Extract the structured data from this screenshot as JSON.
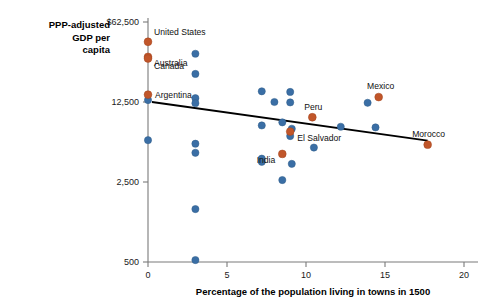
{
  "chart_data": {
    "type": "scatter",
    "title": "",
    "xlabel": "Percentage of the population living in towns in 1500",
    "ylabel": "PPP-adjusted GDP per capita",
    "ylabel_lines": [
      "PPP-adjusted",
      "GDP per",
      "capita"
    ],
    "xlim": [
      0,
      20
    ],
    "ylim": [
      500,
      62500
    ],
    "yscale": "log",
    "grid": false,
    "legend": "none",
    "xticks": [
      0,
      5,
      10,
      15,
      20
    ],
    "xtick_labels": [
      "0",
      "5",
      "10",
      "15",
      "20"
    ],
    "yticks": [
      500,
      2500,
      12500,
      62500
    ],
    "ytick_labels": [
      "500",
      "2,500",
      "12,500",
      "$62,500"
    ],
    "colors": {
      "highlight": "#c1562a",
      "other": "#3a6ea5",
      "trendline": "#000000",
      "axis": "#7a7a7a"
    },
    "series": [
      {
        "name": "Labeled countries",
        "color": "#c1562a",
        "points": [
          {
            "label": "United States",
            "x": 0.0,
            "y": 42000
          },
          {
            "label": "Australia",
            "x": 0.0,
            "y": 31000
          },
          {
            "label": "Canada",
            "x": 0.0,
            "y": 30000
          },
          {
            "label": "Argentina",
            "x": 0.0,
            "y": 14500
          },
          {
            "label": "Peru",
            "x": 10.4,
            "y": 9200
          },
          {
            "label": "Mexico",
            "x": 14.6,
            "y": 13800
          },
          {
            "label": "El Salvador",
            "x": 9.0,
            "y": 6900
          },
          {
            "label": "India",
            "x": 8.5,
            "y": 4400
          },
          {
            "label": "Morocco",
            "x": 17.7,
            "y": 5300
          }
        ]
      },
      {
        "name": "Other countries",
        "color": "#3a6ea5",
        "points": [
          {
            "x": 0.0,
            "y": 13000
          },
          {
            "x": 0.0,
            "y": 5800
          },
          {
            "x": 3.0,
            "y": 33000
          },
          {
            "x": 3.0,
            "y": 22000
          },
          {
            "x": 3.0,
            "y": 13500
          },
          {
            "x": 3.0,
            "y": 12200
          },
          {
            "x": 3.0,
            "y": 5400
          },
          {
            "x": 3.0,
            "y": 4500
          },
          {
            "x": 3.0,
            "y": 1450
          },
          {
            "x": 3.0,
            "y": 520
          },
          {
            "x": 7.2,
            "y": 15500
          },
          {
            "x": 7.2,
            "y": 7800
          },
          {
            "x": 7.2,
            "y": 4000
          },
          {
            "x": 7.2,
            "y": 3750
          },
          {
            "x": 8.0,
            "y": 12500
          },
          {
            "x": 8.5,
            "y": 8300
          },
          {
            "x": 8.5,
            "y": 2600
          },
          {
            "x": 9.0,
            "y": 15300
          },
          {
            "x": 9.0,
            "y": 12400
          },
          {
            "x": 9.0,
            "y": 6300
          },
          {
            "x": 9.1,
            "y": 3600
          },
          {
            "x": 9.1,
            "y": 7300
          },
          {
            "x": 10.5,
            "y": 5000
          },
          {
            "x": 12.2,
            "y": 7600
          },
          {
            "x": 13.9,
            "y": 12300
          },
          {
            "x": 14.4,
            "y": 7500
          }
        ]
      }
    ],
    "trendline": {
      "x_start": 0.25,
      "y_start": 12500,
      "x_end": 17.7,
      "y_end": 5750
    }
  }
}
